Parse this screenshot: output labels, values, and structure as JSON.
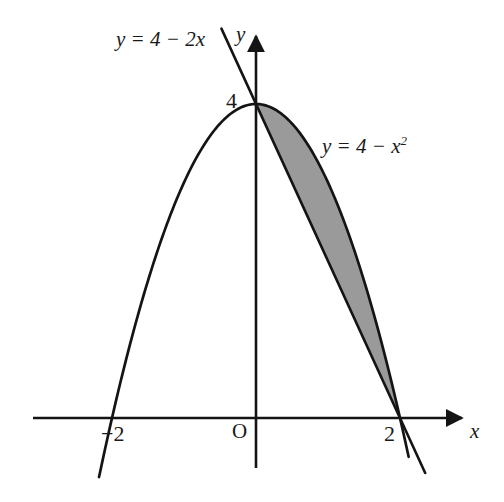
{
  "figure": {
    "background_color": "#ffffff",
    "stroke_color": "#141414",
    "shade_color": "#9a9a9a",
    "labels": {
      "line_equation": "y = 4 − 2x",
      "parabola_equation_base": "y = 4 − x",
      "parabola_equation_exponent": "2",
      "y_axis": "y",
      "x_axis": "x",
      "origin": "O",
      "y_intercept_value": "4",
      "left_root_value": "−2",
      "right_root_value": "2"
    }
  },
  "chart_data": {
    "type": "line",
    "title": "",
    "subtitle": "",
    "xlabel": "x",
    "ylabel": "y",
    "xlim": [
      -3.1,
      2.95
    ],
    "ylim": [
      -0.55,
      4.75
    ],
    "grid": false,
    "legend_position": "inline-annotations",
    "axes": {
      "origin_label": "O",
      "x_axis_arrow": true,
      "y_axis_arrow": true,
      "x_ticks": [
        -2,
        2
      ],
      "x_tick_labels": [
        "−2",
        "2"
      ],
      "y_ticks": [
        4
      ],
      "y_tick_labels": [
        "4"
      ]
    },
    "series": [
      {
        "name": "y = 4 − x²",
        "type": "parabola",
        "expression": "4 - x^2",
        "annotation": "y = 4 − x²",
        "x_domain": [
          -2.18,
          2.12
        ],
        "key_points": [
          {
            "x": -2,
            "y": 0
          },
          {
            "x": -1,
            "y": 3
          },
          {
            "x": 0,
            "y": 4
          },
          {
            "x": 1,
            "y": 3
          },
          {
            "x": 2,
            "y": 0
          }
        ]
      },
      {
        "name": "y = 4 − 2x",
        "type": "line",
        "expression": "4 - 2x",
        "annotation": "y = 4 − 2x",
        "slope": -2,
        "intercept": 4,
        "x_domain": [
          -0.48,
          2.35
        ],
        "key_points": [
          {
            "x": 0,
            "y": 4
          },
          {
            "x": 1,
            "y": 2
          },
          {
            "x": 2,
            "y": 0
          }
        ]
      }
    ],
    "shaded_region": {
      "label": "area between curves",
      "upper_curve": "y = 4 − x²",
      "lower_curve": "y = 4 − 2x",
      "x_from": 0,
      "x_to": 2,
      "fill_color": "#9a9a9a",
      "intersection_points": [
        {
          "x": 0,
          "y": 4
        },
        {
          "x": 2,
          "y": 0
        }
      ]
    }
  }
}
